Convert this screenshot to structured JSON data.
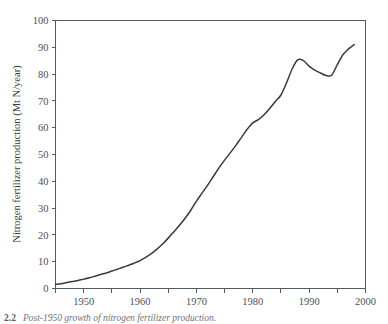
{
  "figure": {
    "caption_number": "2.2",
    "caption_text": "Post-1950 growth of nitrogen fertilizer production."
  },
  "chart_data": {
    "type": "line",
    "title": "",
    "xlabel": "",
    "ylabel": "Nitrogen fertilizer production (Mt N/year)",
    "xlim": [
      1945,
      2000
    ],
    "ylim": [
      0,
      100
    ],
    "grid": false,
    "legend": "none",
    "line_color": "#3a3a3a",
    "x_ticks_major": [
      1950,
      1960,
      1970,
      1980,
      1990,
      2000
    ],
    "x_tick_labels": [
      "1950",
      "1960",
      "1970",
      "1980",
      "1990",
      "2000"
    ],
    "x_ticks_minor": [
      1945,
      1955,
      1965,
      1975,
      1985,
      1995
    ],
    "y_ticks": [
      0,
      10,
      20,
      30,
      40,
      50,
      60,
      70,
      80,
      90,
      100
    ],
    "y_tick_labels": [
      "0",
      "10",
      "20",
      "30",
      "40",
      "50",
      "60",
      "70",
      "80",
      "90",
      "100"
    ],
    "series": [
      {
        "name": "Nitrogen fertilizer production",
        "x": [
          1945,
          1946,
          1947,
          1948,
          1949,
          1950,
          1951,
          1952,
          1953,
          1954,
          1955,
          1956,
          1957,
          1958,
          1959,
          1960,
          1961,
          1962,
          1963,
          1964,
          1965,
          1966,
          1967,
          1968,
          1969,
          1970,
          1971,
          1972,
          1973,
          1974,
          1975,
          1976,
          1977,
          1978,
          1979,
          1980,
          1981,
          1982,
          1983,
          1984,
          1985,
          1986,
          1987,
          1988,
          1989,
          1990,
          1991,
          1992,
          1993,
          1994,
          1995,
          1996,
          1997,
          1998
        ],
        "y": [
          1.5,
          1.8,
          2.2,
          2.6,
          3.0,
          3.5,
          4.0,
          4.6,
          5.2,
          5.8,
          6.5,
          7.2,
          7.9,
          8.7,
          9.5,
          10.4,
          11.6,
          13.0,
          14.7,
          16.6,
          18.8,
          21.2,
          23.6,
          26.2,
          29.2,
          32.6,
          35.6,
          38.6,
          41.8,
          45.0,
          47.9,
          50.6,
          53.4,
          56.4,
          59.4,
          61.8,
          63.0,
          64.8,
          67.2,
          69.8,
          72.2,
          76.8,
          82.0,
          85.4,
          85.0,
          83.0,
          81.5,
          80.4,
          79.5,
          79.6,
          83.5,
          87.2,
          89.4,
          91.0
        ]
      }
    ],
    "annotations": [
      {
        "label": "peak",
        "x": 1988,
        "y": 85.4
      },
      {
        "label": "trough",
        "x": 1993,
        "y": 79.5
      },
      {
        "label": "start",
        "x": 1945,
        "y": 1.5
      },
      {
        "label": "end",
        "x": 1998,
        "y": 91.0
      }
    ]
  }
}
